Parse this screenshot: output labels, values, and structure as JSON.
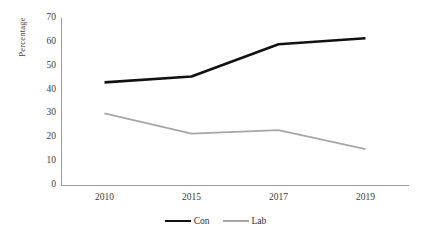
{
  "chart_data": {
    "type": "line",
    "title": "",
    "xlabel": "",
    "ylabel": "Percentage",
    "categories": [
      "2010",
      "2015",
      "2017",
      "2019"
    ],
    "ylim": [
      0,
      70
    ],
    "yticks": [
      70,
      60,
      50,
      40,
      30,
      20,
      10,
      0
    ],
    "grid": false,
    "legend_position": "bottom",
    "series": [
      {
        "name": "Con",
        "color": "#111111",
        "line_width": 2.6,
        "values": [
          43,
          45.5,
          59,
          61.5
        ]
      },
      {
        "name": "Lab",
        "color": "#a6a6a6",
        "line_width": 1.8,
        "values": [
          30,
          21.5,
          23,
          15
        ]
      }
    ]
  },
  "axes": {
    "axis_color": "#9a9a9a",
    "tick_font_size": 9.5
  }
}
